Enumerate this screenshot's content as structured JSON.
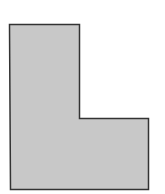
{
  "diagram": {
    "shape": "L-shape",
    "fill_color": "#c8c8c8",
    "stroke_color": "#333333",
    "background_color": "#ffffff",
    "points": "9.5,24.5 79.5,24.5 79.5,118.5 148.5,118.5 148.5,189.5 10.5,189.5"
  }
}
